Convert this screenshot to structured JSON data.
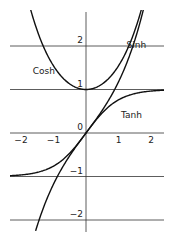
{
  "chart_data": {
    "type": "line",
    "title": "",
    "xlabel": "",
    "ylabel": "",
    "xlim": [
      -2.4,
      2.4
    ],
    "ylim": [
      -2.3,
      3.0
    ],
    "x_ticks": [
      -2,
      -1,
      0,
      1,
      2
    ],
    "x_tick_labels": [
      "-2",
      "-1",
      "",
      "1",
      "2"
    ],
    "y_ticks": [
      -2,
      -1,
      0,
      1,
      2
    ],
    "y_tick_labels": [
      "-2",
      "-1",
      "0",
      "1",
      "2"
    ],
    "grid": "horizontal lines at y = -2, -1, 0, 1, 2",
    "series": [
      {
        "name": "Cosh",
        "function": "cosh(x)",
        "x_range": [
          -1.85,
          1.85
        ]
      },
      {
        "name": "Sinh",
        "function": "sinh(x)",
        "x_range": [
          -1.55,
          1.85
        ]
      },
      {
        "name": "Tanh",
        "function": "tanh(x)",
        "x_range": [
          -2.4,
          2.4
        ]
      }
    ],
    "annotations": [
      {
        "text": "Cosh",
        "x": -1.3,
        "y": 1.35
      },
      {
        "text": "Sinh",
        "x": 1.55,
        "y": 1.95
      },
      {
        "text": "Tanh",
        "x": 1.4,
        "y": 0.35
      }
    ]
  },
  "layout": {
    "origin_px": [
      86,
      133
    ],
    "px_per_x": 32.5,
    "px_per_y": 43.5,
    "line_color": "#111111"
  }
}
